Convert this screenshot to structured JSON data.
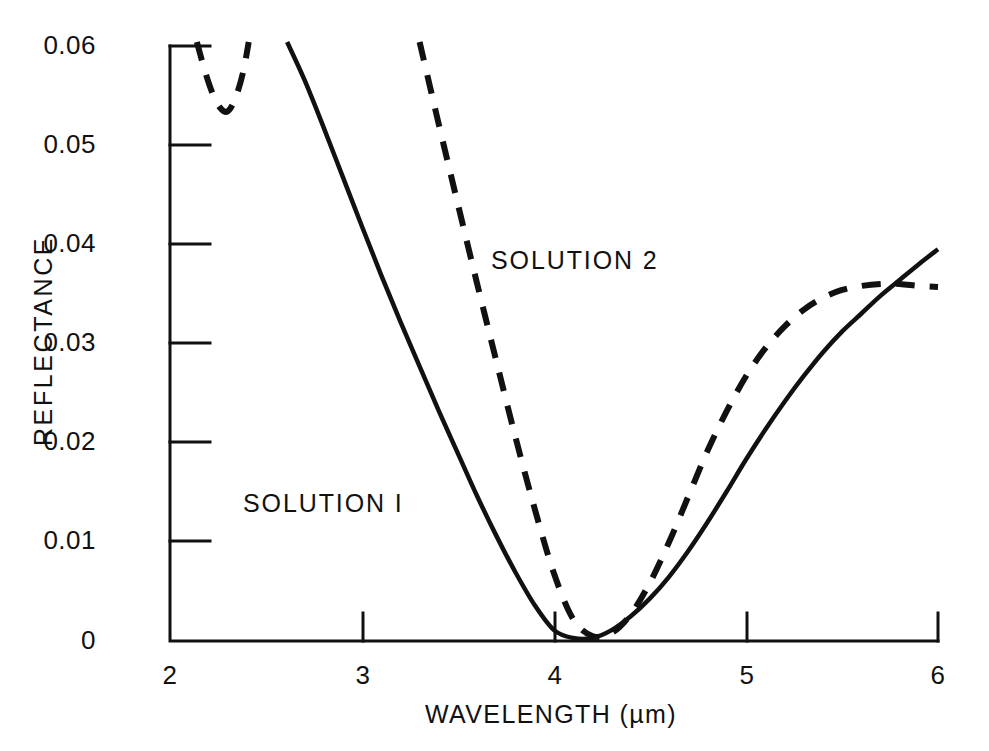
{
  "chart_data": {
    "type": "line",
    "title": "",
    "xlabel": "WAVELENGTH (µm)",
    "ylabel": "REFLECTANCE",
    "xlim": [
      2,
      6
    ],
    "ylim": [
      0,
      0.06
    ],
    "xticks": [
      "2",
      "3",
      "4",
      "5",
      "6"
    ],
    "xtick_values": [
      2,
      3,
      4,
      5,
      6
    ],
    "yticks": [
      "0",
      "0.01",
      "0.02",
      "0.03",
      "0.04",
      "0.05",
      "0.06"
    ],
    "ytick_values": [
      0,
      0.01,
      0.02,
      0.03,
      0.04,
      0.05,
      0.06
    ],
    "grid": false,
    "legend_position": "inline-annotations",
    "series": [
      {
        "name": "SOLUTION I",
        "style": "solid",
        "color": "#111111",
        "annotation": {
          "text": "SOLUTION I",
          "x": 2.95,
          "y": 0.0145
        },
        "x": [
          2.61,
          2.7,
          2.8,
          2.9,
          3.0,
          3.1,
          3.2,
          3.3,
          3.4,
          3.5,
          3.6,
          3.7,
          3.8,
          3.9,
          4.0,
          4.1,
          4.2,
          4.3,
          4.4,
          4.5,
          4.6,
          4.7,
          4.8,
          4.9,
          5.0,
          5.1,
          5.2,
          5.3,
          5.4,
          5.5,
          5.6,
          5.7,
          5.8,
          5.9,
          6.0
        ],
        "y": [
          0.0604,
          0.0566,
          0.0518,
          0.0468,
          0.0418,
          0.0369,
          0.0322,
          0.0277,
          0.0232,
          0.0189,
          0.0146,
          0.0106,
          0.0069,
          0.0036,
          0.0011,
          0.0003,
          0.0003,
          0.0011,
          0.0025,
          0.0043,
          0.0065,
          0.0091,
          0.012,
          0.0151,
          0.0183,
          0.0213,
          0.0241,
          0.0267,
          0.0291,
          0.0312,
          0.033,
          0.0348,
          0.0364,
          0.038,
          0.0395
        ]
      },
      {
        "name": "SOLUTION 2",
        "style": "dashed",
        "color": "#111111",
        "annotation": {
          "text": "SOLUTION 2",
          "x": 3.67,
          "y": 0.0395
        },
        "segments": [
          {
            "comment": "upper-left short V dip near 2.15-2.40 um",
            "x": [
              2.14,
              2.18,
              2.22,
              2.26,
              2.3,
              2.34,
              2.38,
              2.41
            ],
            "y": [
              0.0604,
              0.0576,
              0.0553,
              0.0538,
              0.0534,
              0.0547,
              0.0573,
              0.0604
            ]
          },
          {
            "comment": "main band from 3.30 um to 6.00 um",
            "x": [
              3.3,
              3.4,
              3.5,
              3.6,
              3.7,
              3.8,
              3.9,
              4.0,
              4.1,
              4.2,
              4.3,
              4.4,
              4.5,
              4.6,
              4.7,
              4.8,
              4.9,
              5.0,
              5.1,
              5.2,
              5.3,
              5.4,
              5.5,
              5.6,
              5.7,
              5.8,
              5.9,
              6.0
            ],
            "y": [
              0.0604,
              0.0521,
              0.044,
              0.036,
              0.0282,
              0.0205,
              0.0133,
              0.0068,
              0.0022,
              0.0005,
              0.0008,
              0.0027,
              0.0059,
              0.01,
              0.0146,
              0.0192,
              0.0232,
              0.0267,
              0.0295,
              0.0317,
              0.0334,
              0.0346,
              0.0354,
              0.0358,
              0.036,
              0.036,
              0.0358,
              0.0357
            ]
          }
        ]
      }
    ]
  },
  "axes": {
    "x_tick_labels": [
      "2",
      "3",
      "4",
      "5",
      "6"
    ],
    "y_tick_labels": [
      "0.06",
      "0.05",
      "0.04",
      "0.03",
      "0.02",
      "0.01",
      "0"
    ],
    "x_axis_title": "WAVELENGTH (µm)",
    "y_axis_title": "REFLECTANCE"
  },
  "annotations": {
    "solution_one": "SOLUTION I",
    "solution_two": "SOLUTION 2"
  },
  "colors": {
    "background": "#ffffff",
    "ink": "#111111",
    "curve": "#111111"
  }
}
